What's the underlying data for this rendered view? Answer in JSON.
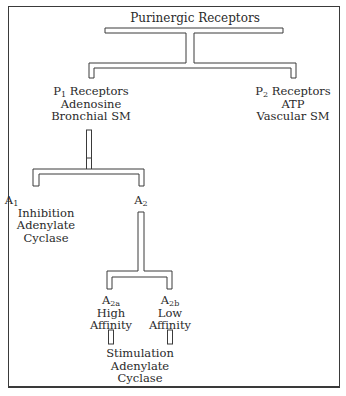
{
  "diagram": {
    "title": "Purinergic Receptors",
    "nodes": {
      "p1": {
        "symbol": "P",
        "sub": "1",
        "name": " Receptors",
        "lines": [
          "Adenosine",
          "Bronchial SM"
        ]
      },
      "p2": {
        "symbol": "P",
        "sub": "2",
        "name": " Receptors",
        "lines": [
          "ATP",
          "Vascular SM"
        ]
      },
      "a1": {
        "symbol": "A",
        "sub": "1",
        "lines": [
          "Inhibition",
          "Adenylate",
          "Cyclase"
        ]
      },
      "a2": {
        "symbol": "A",
        "sub": "2"
      },
      "a2a": {
        "symbol": "A",
        "sub": "2a",
        "lines": [
          "High",
          "Affinity"
        ]
      },
      "a2b": {
        "symbol": "A",
        "sub": "2b",
        "lines": [
          "Low",
          "Affinity"
        ]
      },
      "effect": {
        "lines": [
          "Stimulation",
          "Adenylate",
          "Cyclase"
        ]
      }
    },
    "edges": [
      [
        "Purinergic Receptors",
        "P1 Receptors"
      ],
      [
        "Purinergic Receptors",
        "P2 Receptors"
      ],
      [
        "P1 Receptors",
        "A1"
      ],
      [
        "P1 Receptors",
        "A2"
      ],
      [
        "A2",
        "A2a"
      ],
      [
        "A2",
        "A2b"
      ],
      [
        "A2a",
        "Stimulation Adenylate Cyclase"
      ],
      [
        "A2b",
        "Stimulation Adenylate Cyclase"
      ]
    ],
    "colors": {
      "stroke": "#3a3a3a",
      "text": "#2a2a2a",
      "background": "#ffffff"
    }
  }
}
